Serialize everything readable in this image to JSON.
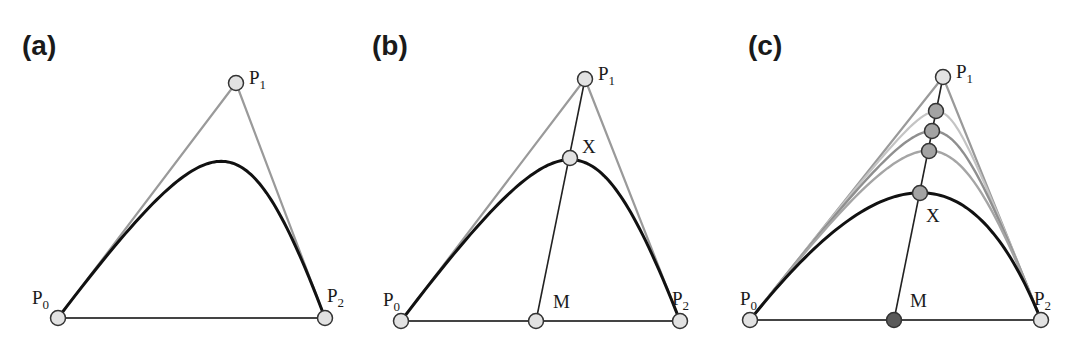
{
  "figure": {
    "panels": [
      {
        "id": "a",
        "label": "(a)",
        "label_pos": [
          22,
          55
        ],
        "points": {
          "P0": [
            58,
            318
          ],
          "P1": [
            236,
            83
          ],
          "P2": [
            325,
            318
          ]
        },
        "point_labels": [
          {
            "name": "P0",
            "main": "P",
            "sub": "0",
            "x": 32,
            "y": 304
          },
          {
            "name": "P1",
            "main": "P",
            "sub": "1",
            "x": 249,
            "y": 84
          },
          {
            "name": "P2",
            "main": "P",
            "sub": "2",
            "x": 327,
            "y": 302
          }
        ],
        "curves": [
          {
            "weight": 2.0,
            "style": "main"
          }
        ],
        "markers": [
          {
            "name": "P0",
            "x": 58,
            "y": 318,
            "fill": "light"
          },
          {
            "name": "P1",
            "x": 236,
            "y": 83,
            "fill": "light"
          },
          {
            "name": "P2",
            "x": 325,
            "y": 318,
            "fill": "light"
          }
        ],
        "extra_lines": []
      },
      {
        "id": "b",
        "label": "(b)",
        "label_pos": [
          372,
          55
        ],
        "points": {
          "P0": [
            401,
            321
          ],
          "P1": [
            585,
            79
          ],
          "P2": [
            680,
            321
          ]
        },
        "point_labels": [
          {
            "name": "P0",
            "main": "P",
            "sub": "0",
            "x": 383,
            "y": 306
          },
          {
            "name": "P1",
            "main": "P",
            "sub": "1",
            "x": 598,
            "y": 80
          },
          {
            "name": "P2",
            "main": "P",
            "sub": "2",
            "x": 672,
            "y": 305
          },
          {
            "name": "X",
            "main": "X",
            "sub": "",
            "x": 582,
            "y": 153
          },
          {
            "name": "M",
            "main": "M",
            "sub": "",
            "x": 553,
            "y": 308
          }
        ],
        "curves": [
          {
            "weight": 2.0,
            "style": "main"
          }
        ],
        "markers": [
          {
            "name": "P0",
            "x": 401,
            "y": 321,
            "fill": "light"
          },
          {
            "name": "M",
            "x": 536,
            "y": 321,
            "fill": "light"
          },
          {
            "name": "P2",
            "x": 680,
            "y": 321,
            "fill": "light"
          },
          {
            "name": "X",
            "x": 570,
            "y": 158,
            "fill": "light"
          },
          {
            "name": "P1",
            "x": 585,
            "y": 79,
            "fill": "light"
          }
        ],
        "extra_lines": [
          {
            "from": [
              536,
              321
            ],
            "to": [
              585,
              79
            ]
          }
        ]
      },
      {
        "id": "c",
        "label": "(c)",
        "label_pos": [
          748,
          55
        ],
        "points": {
          "P0": [
            750,
            320
          ],
          "P1": [
            943,
            77
          ],
          "P2": [
            1041,
            320
          ]
        },
        "point_labels": [
          {
            "name": "P0",
            "main": "P",
            "sub": "0",
            "x": 740,
            "y": 305
          },
          {
            "name": "P1",
            "main": "P",
            "sub": "1",
            "x": 956,
            "y": 78
          },
          {
            "name": "P2",
            "main": "P",
            "sub": "2",
            "x": 1034,
            "y": 305
          },
          {
            "name": "X",
            "main": "X",
            "sub": "",
            "x": 926,
            "y": 222
          },
          {
            "name": "M",
            "main": "M",
            "sub": "",
            "x": 910,
            "y": 307
          }
        ],
        "curves": [
          {
            "weight": 6.1,
            "style": "faint"
          },
          {
            "weight": 3.5,
            "style": "mid"
          },
          {
            "weight": 2.3,
            "style": "mid2"
          },
          {
            "weight": 1.1,
            "style": "main"
          }
        ],
        "markers": [
          {
            "name": "P0",
            "x": 750,
            "y": 320,
            "fill": "light"
          },
          {
            "name": "M",
            "x": 894,
            "y": 320,
            "fill": "dark"
          },
          {
            "name": "P2",
            "x": 1041,
            "y": 320,
            "fill": "light"
          },
          {
            "name": "X",
            "x": 920,
            "y": 193,
            "fill": "mid"
          },
          {
            "name": "X3",
            "x": 929,
            "y": 151,
            "fill": "mid"
          },
          {
            "name": "X2",
            "x": 932,
            "y": 131,
            "fill": "mid"
          },
          {
            "name": "X1",
            "x": 936,
            "y": 111,
            "fill": "mid"
          },
          {
            "name": "P1",
            "x": 943,
            "y": 77,
            "fill": "light"
          }
        ],
        "extra_lines": [
          {
            "from": [
              894,
              320
            ],
            "to": [
              943,
              77
            ]
          }
        ]
      }
    ],
    "colors": {
      "polygon": "#9a9a9a",
      "curve_main": "#111111",
      "curve_faint": "#c4c4c4",
      "curve_mid": "#8f8f8f",
      "curve_mid2": "#a5a5a5",
      "construction_line": "#222222",
      "base_line": "#444444",
      "marker_stroke": "#333333",
      "marker_light": "#e2e2e2",
      "marker_mid": "#a3a3a3",
      "marker_dark": "#5a5a5a"
    }
  }
}
